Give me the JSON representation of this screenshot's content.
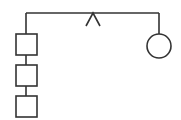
{
  "diagram": {
    "background": "#ffffff",
    "stroke_color": "#333333",
    "stroke_width": 1.6,
    "top_bus": {
      "x1": 26,
      "y1": 13,
      "x2": 159,
      "y2": 13
    },
    "caret": {
      "apex_x": 93,
      "apex_y": 13,
      "left_x": 86,
      "right_x": 100,
      "base_y": 26
    },
    "left_stem": {
      "x": 26,
      "y1": 13,
      "y2": 34
    },
    "boxes": [
      {
        "x": 16,
        "y": 34,
        "w": 21,
        "h": 21
      },
      {
        "x": 16,
        "y": 65,
        "w": 21,
        "h": 21
      },
      {
        "x": 16,
        "y": 96,
        "w": 21,
        "h": 21
      }
    ],
    "box_links": [
      {
        "x": 26,
        "y1": 55,
        "y2": 65
      },
      {
        "x": 26,
        "y1": 86,
        "y2": 96
      }
    ],
    "right_stem": {
      "x": 159,
      "y1": 13,
      "y2": 34
    },
    "circle": {
      "cx": 159,
      "cy": 46,
      "r": 12
    }
  }
}
